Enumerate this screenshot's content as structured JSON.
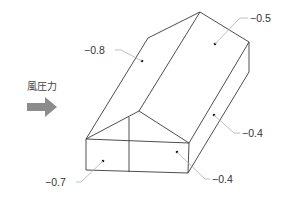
{
  "diagram": {
    "type": "wind-pressure-coefficient-diagram",
    "wind_label": "風圧力",
    "wind_arrow_color": "#8c8c8c",
    "line_color": "#3a3a3a",
    "leader_color": "#b0b0b0",
    "coefficients": {
      "windward_roof": "−0.8",
      "leeward_roof": "−0.5",
      "side_wall": "−0.4",
      "gable_wall_right": "−0.4",
      "gable_wall_left": "−0.7"
    }
  }
}
